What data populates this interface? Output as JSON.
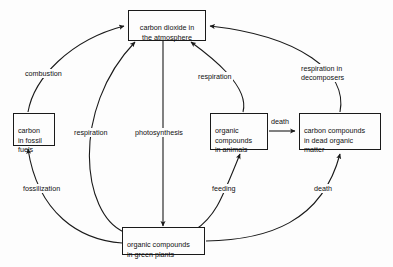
{
  "diagram": {
    "title_text": "",
    "colors": {
      "background": "#fdfdfd",
      "stroke": "#1a1a1a",
      "text": "#111111"
    },
    "nodes": [
      {
        "id": "atmosphere",
        "label": "carbon dioxide in\nthe atmosphere"
      },
      {
        "id": "fossil-fuels",
        "label": "carbon\nin fossil\nfuels"
      },
      {
        "id": "animals",
        "label": "organic\ncompounds\nin animals"
      },
      {
        "id": "dead-matter",
        "label": "carbon compounds\nin dead organic\nmatter"
      },
      {
        "id": "green-plants",
        "label": "organic compounds\nin green plants"
      }
    ],
    "edges": [
      {
        "id": "combustion",
        "label": "combustion",
        "from": "fossil-fuels",
        "to": "atmosphere"
      },
      {
        "id": "respiration-plants",
        "label": "respiration",
        "from": "green-plants",
        "to": "atmosphere"
      },
      {
        "id": "photosynthesis",
        "label": "photosynthesis",
        "from": "atmosphere",
        "to": "green-plants"
      },
      {
        "id": "respiration-animals",
        "label": "respiration",
        "from": "animals",
        "to": "atmosphere"
      },
      {
        "id": "respiration-decomposers",
        "label": "respiration in\ndecomposers",
        "from": "dead-matter",
        "to": "atmosphere"
      },
      {
        "id": "fossilization",
        "label": "fossilization",
        "from": "green-plants",
        "to": "fossil-fuels"
      },
      {
        "id": "feeding",
        "label": "feeding",
        "from": "green-plants",
        "to": "animals"
      },
      {
        "id": "death-animals",
        "label": "death",
        "from": "animals",
        "to": "dead-matter"
      },
      {
        "id": "death-plants",
        "label": "death",
        "from": "green-plants",
        "to": "dead-matter"
      }
    ]
  }
}
